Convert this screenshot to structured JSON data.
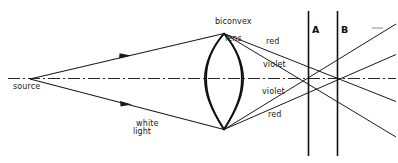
{
  "figure": {
    "background_color": "#ffffff",
    "ink_color": "#1a1a1a",
    "width": 398,
    "height": 163
  },
  "labels": {
    "source": "source",
    "white_light": "white\nlight",
    "lens_line1": "biconvex",
    "lens_line2": "lens",
    "red_upper": "red",
    "violet_upper": "violet",
    "violet_lower": "violet",
    "red_lower": "red",
    "screen_a": "A",
    "screen_b": "B"
  },
  "chart_data": {
    "type": "diagram",
    "elements": {
      "optical_axis": {
        "name": "optical-axis",
        "style": "dash-dot",
        "y": 78,
        "x_start": 8,
        "x_end": 396
      },
      "source_point": {
        "x": 30,
        "y": 79,
        "label": "source"
      },
      "lens": {
        "name": "biconvex-lens",
        "top_vertex": {
          "x": 224,
          "y": 33
        },
        "bottom_vertex": {
          "x": 224,
          "y": 130
        },
        "left_bulge_x": 206,
        "right_bulge_x": 250,
        "center_y": 78
      },
      "incident_rays": [
        {
          "name": "upper-white-ray",
          "from": [
            30,
            79
          ],
          "to": [
            224,
            33
          ],
          "arrow_at": [
            126,
            56
          ]
        },
        {
          "name": "lower-white-ray",
          "from": [
            30,
            79
          ],
          "to": [
            224,
            130
          ],
          "arrow_at": [
            127,
            103
          ]
        }
      ],
      "refracted_rays": [
        {
          "name": "upper-red-ray",
          "from": [
            224,
            33
          ],
          "through": [
            337,
            78
          ],
          "to": [
            396,
            101
          ],
          "color_label": "red"
        },
        {
          "name": "upper-violet-ray",
          "from": [
            224,
            33
          ],
          "through": [
            308,
            78
          ],
          "to": [
            396,
            137
          ],
          "color_label": "violet"
        },
        {
          "name": "lower-violet-ray",
          "from": [
            224,
            130
          ],
          "through": [
            308,
            78
          ],
          "to": [
            396,
            24
          ],
          "color_label": "violet"
        },
        {
          "name": "lower-red-ray",
          "from": [
            224,
            130
          ],
          "through": [
            337,
            78
          ],
          "to": [
            396,
            54
          ],
          "color_label": "red"
        }
      ],
      "screens": [
        {
          "name": "screen-a",
          "label": "A",
          "x": 308,
          "y_top": 11,
          "y_bottom": 156,
          "focus_point": [
            308,
            78
          ],
          "focus_of": "violet"
        },
        {
          "name": "screen-b",
          "label": "B",
          "x": 337,
          "y_top": 11,
          "y_bottom": 156,
          "focus_point": [
            337,
            78
          ],
          "focus_of": "red"
        }
      ],
      "stray_dash": {
        "name": "stray-dash-mark",
        "x1": 372,
        "x2": 383,
        "y": 28
      }
    }
  }
}
